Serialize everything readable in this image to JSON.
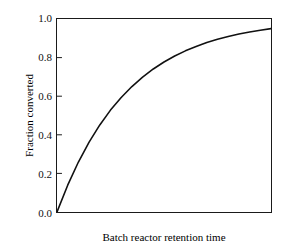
{
  "chart_data": {
    "type": "line",
    "title": "",
    "xlabel": "Batch reactor retention time",
    "ylabel": "Fraction converted",
    "xlim": [
      0,
      1
    ],
    "ylim": [
      0.0,
      1.0
    ],
    "grid": false,
    "legend": null,
    "x_tick_labels": [],
    "y_tick_labels": [
      "0.0",
      "0.2",
      "0.4",
      "0.6",
      "0.8",
      "1.0"
    ],
    "y_tick_values": [
      0.0,
      0.2,
      0.4,
      0.6,
      0.8,
      1.0
    ],
    "curve_color": "#111111",
    "axis_color": "#1a1a1a",
    "background_color": "#ffffff",
    "series": [
      {
        "name": "fraction converted",
        "model": "1 - exp(-k*t), k = 3.0",
        "x": [
          0.0,
          0.05,
          0.1,
          0.15,
          0.2,
          0.25,
          0.3,
          0.35,
          0.4,
          0.45,
          0.5,
          0.55,
          0.6,
          0.65,
          0.7,
          0.75,
          0.8,
          0.85,
          0.9,
          0.95,
          1.0
        ],
        "values": [
          0.0,
          0.139,
          0.259,
          0.362,
          0.451,
          0.528,
          0.593,
          0.65,
          0.699,
          0.741,
          0.777,
          0.808,
          0.835,
          0.857,
          0.878,
          0.895,
          0.909,
          0.922,
          0.933,
          0.942,
          0.95
        ]
      }
    ]
  },
  "axis": {
    "y_ticks": [
      {
        "label": "1.0",
        "value": 1.0
      },
      {
        "label": "0.8",
        "value": 0.8
      },
      {
        "label": "0.6",
        "value": 0.6
      },
      {
        "label": "0.4",
        "value": 0.4
      },
      {
        "label": "0.2",
        "value": 0.2
      },
      {
        "label": "0.0",
        "value": 0.0
      }
    ]
  },
  "labels": {
    "y_axis_title": "Fraction converted",
    "x_axis_title": "Batch reactor retention time"
  }
}
